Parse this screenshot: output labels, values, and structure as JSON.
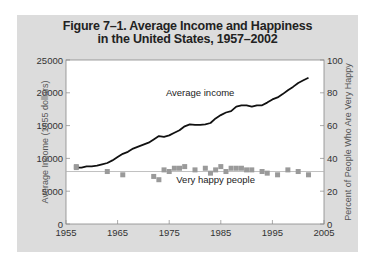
{
  "chart_data": {
    "type": "line",
    "title": "Figure 7–1. Average Income and Happiness in the United States, 1957–2002",
    "title_line1": "Figure 7–1. Average Income and Happiness",
    "title_line2": "in the United States, 1957–2002",
    "xlabel": "",
    "ylabel": "Average Income (1955 dollars)",
    "y2label": "Percent of People Who Are Very Happy",
    "xlim": [
      1955,
      2005
    ],
    "ylim": [
      0,
      25000
    ],
    "y2lim": [
      0,
      100
    ],
    "x_ticks": [
      "1955",
      "1965",
      "1975",
      "1985",
      "1995",
      "2005"
    ],
    "y_ticks": [
      "0",
      "5000",
      "10000",
      "15000",
      "20000",
      "25000"
    ],
    "y2_ticks": [
      "0",
      "20",
      "40",
      "60",
      "80",
      "100"
    ],
    "grid": false,
    "colors": {
      "income": "#111111",
      "happy": "#9a9a9a",
      "reference_line": "#b0b0b0",
      "panel": "#dcdcdc"
    },
    "series": [
      {
        "name": "Average income",
        "axis": "left",
        "style": "line",
        "x": [
          1957,
          1958,
          1959,
          1960,
          1961,
          1962,
          1963,
          1964,
          1965,
          1966,
          1967,
          1968,
          1969,
          1970,
          1971,
          1972,
          1973,
          1974,
          1975,
          1976,
          1977,
          1978,
          1979,
          1980,
          1981,
          1982,
          1983,
          1984,
          1985,
          1986,
          1987,
          1988,
          1989,
          1990,
          1991,
          1992,
          1993,
          1994,
          1995,
          1996,
          1997,
          1998,
          1999,
          2000,
          2001,
          2002
        ],
        "values": [
          8600,
          8600,
          8800,
          8800,
          8900,
          9100,
          9300,
          9700,
          10200,
          10700,
          11000,
          11500,
          11800,
          12100,
          12400,
          12900,
          13400,
          13300,
          13500,
          13900,
          14300,
          14900,
          15200,
          15100,
          15100,
          15200,
          15400,
          16100,
          16600,
          17000,
          17200,
          17900,
          18100,
          18100,
          17900,
          18100,
          18100,
          18500,
          19000,
          19300,
          19800,
          20400,
          20900,
          21500,
          21900,
          22300
        ]
      },
      {
        "name": "Very happy people",
        "axis": "right",
        "style": "markers",
        "x": [
          1957,
          1963,
          1966,
          1972,
          1973,
          1974,
          1975,
          1976,
          1977,
          1978,
          1980,
          1982,
          1983,
          1984,
          1985,
          1986,
          1987,
          1988,
          1989,
          1990,
          1991,
          1993,
          1994,
          1996,
          1998,
          2000,
          2002
        ],
        "values": [
          35,
          32,
          30,
          29,
          27,
          33,
          32,
          34,
          34,
          35,
          33,
          34,
          31,
          33,
          35,
          32,
          34,
          34,
          34,
          33,
          33,
          32,
          31,
          30,
          33,
          32,
          30
        ]
      }
    ],
    "reference_line": {
      "axis": "right",
      "value": 32
    },
    "annotations": [
      {
        "text": "Average income",
        "x": 1981,
        "y": 19500
      },
      {
        "text": "Very happy people",
        "x": 1984,
        "y": 6200
      }
    ]
  }
}
